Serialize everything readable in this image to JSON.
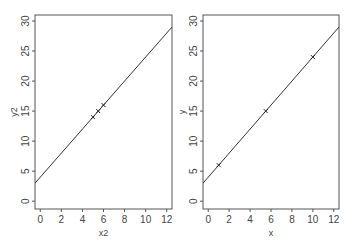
{
  "chart_data": [
    {
      "type": "scatter",
      "title": "",
      "xlabel": "x2",
      "ylabel": "y2",
      "xlim": [
        -0.5,
        12.5
      ],
      "ylim": [
        -1.3,
        31
      ],
      "xticks": [
        0,
        2,
        4,
        6,
        8,
        10,
        12
      ],
      "yticks": [
        0,
        5,
        10,
        15,
        20,
        25,
        30
      ],
      "grid": false,
      "marker": "x",
      "points": [
        {
          "x": 5,
          "y": 14
        },
        {
          "x": 5.5,
          "y": 15
        },
        {
          "x": 6,
          "y": 16
        }
      ],
      "fit_line": {
        "intercept": 4,
        "slope": 2
      }
    },
    {
      "type": "scatter",
      "title": "",
      "xlabel": "x",
      "ylabel": "y",
      "xlim": [
        -0.5,
        12.5
      ],
      "ylim": [
        -1.3,
        31
      ],
      "xticks": [
        0,
        2,
        4,
        6,
        8,
        10,
        12
      ],
      "yticks": [
        0,
        5,
        10,
        15,
        20,
        25,
        30
      ],
      "grid": false,
      "marker": "x",
      "points": [
        {
          "x": 1,
          "y": 6
        },
        {
          "x": 5.5,
          "y": 15
        },
        {
          "x": 10,
          "y": 24
        }
      ],
      "fit_line": {
        "intercept": 4,
        "slope": 2
      }
    }
  ],
  "panels": [
    {
      "xlabel": "x2",
      "ylabel": "y2"
    },
    {
      "xlabel": "x",
      "ylabel": "y"
    }
  ],
  "colors": {
    "frame": "#555555",
    "line": "#333333",
    "text": "#444444"
  }
}
